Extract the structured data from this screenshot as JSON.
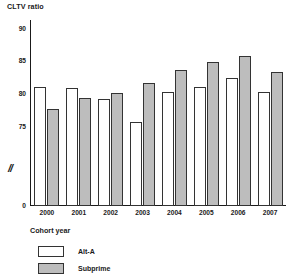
{
  "chart_data": {
    "type": "bar",
    "title": "",
    "ylabel": "CLTV ratio",
    "xlabel": "Cohort year",
    "categories": [
      "2000",
      "2001",
      "2002",
      "2003",
      "2004",
      "2005",
      "2006",
      "2007"
    ],
    "series": [
      {
        "name": "Alt-A",
        "values": [
          81.2,
          81.0,
          79.3,
          75.8,
          80.3,
          81.2,
          82.5,
          80.3
        ],
        "color": "#ffffff"
      },
      {
        "name": "Subprime",
        "values": [
          77.7,
          79.5,
          80.2,
          81.8,
          83.8,
          84.9,
          85.8,
          83.4
        ],
        "color": "#bdbdbd"
      }
    ],
    "ylim": [
      73.5,
      90.5
    ],
    "yticks": [
      "90",
      "85",
      "80",
      "75",
      "0"
    ],
    "ytick_values": [
      90,
      85,
      80,
      75,
      0
    ],
    "axis_break_marker": "//",
    "grid": false,
    "legend_position": "bottom-left"
  },
  "axis": {
    "y_title": "CLTV ratio",
    "x_title": "Cohort year",
    "break_marker": "//",
    "zero_label": "0"
  },
  "legend": {
    "items": [
      {
        "label": "Alt-A",
        "color": "#ffffff"
      },
      {
        "label": "Subprime",
        "color": "#bdbdbd"
      }
    ]
  },
  "colors": {
    "alt_a": "#ffffff",
    "subprime": "#bdbdbd",
    "outline": "#333333",
    "axis": "#1a1a1a",
    "background": "#ffffff"
  }
}
